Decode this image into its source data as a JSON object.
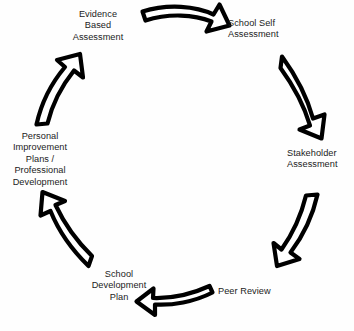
{
  "diagram": {
    "type": "cycle",
    "direction": "clockwise",
    "stage_count": 6,
    "colors": {
      "background": "#fefefe",
      "arrow_fill": "#ffffff",
      "arrow_stroke": "#000000",
      "text": "#1b1b1b"
    },
    "stages": [
      {
        "id": "evidence-based-assessment",
        "label": "Evidence\nBased\nAssessment",
        "position": "top-left",
        "order": 1
      },
      {
        "id": "school-self-assessment",
        "label": "School Self\nAssessment",
        "position": "top-right",
        "order": 2
      },
      {
        "id": "stakeholder-assessment",
        "label": "Stakeholder\nAssessment",
        "position": "right",
        "order": 3
      },
      {
        "id": "peer-review",
        "label": "Peer Review",
        "position": "bottom-right",
        "order": 4
      },
      {
        "id": "school-development-plan",
        "label": "School\nDevelopment\nPlan",
        "position": "bottom-left",
        "order": 5
      },
      {
        "id": "personal-improvement-plans",
        "label": "Personal\nImprovement\nPlans /\nProfessional\nDevelopment",
        "position": "left",
        "order": 6
      }
    ],
    "arrows": [
      {
        "id": "arrow-top",
        "from": "evidence-based-assessment",
        "to": "school-self-assessment",
        "direction": "right"
      },
      {
        "id": "arrow-upper-right",
        "from": "school-self-assessment",
        "to": "stakeholder-assessment",
        "direction": "down-right"
      },
      {
        "id": "arrow-lower-right",
        "from": "stakeholder-assessment",
        "to": "peer-review",
        "direction": "down-left"
      },
      {
        "id": "arrow-bottom",
        "from": "peer-review",
        "to": "school-development-plan",
        "direction": "left"
      },
      {
        "id": "arrow-lower-left",
        "from": "school-development-plan",
        "to": "personal-improvement-plans",
        "direction": "up-left"
      },
      {
        "id": "arrow-upper-left",
        "from": "personal-improvement-plans",
        "to": "evidence-based-assessment",
        "direction": "up-right"
      }
    ]
  }
}
